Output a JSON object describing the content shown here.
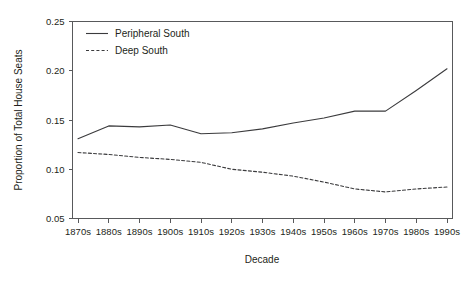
{
  "chart_data": {
    "type": "line",
    "title": "",
    "xlabel": "Decade",
    "ylabel": "Proportion of Total House Seats",
    "categories": [
      "1870s",
      "1880s",
      "1890s",
      "1900s",
      "1910s",
      "1920s",
      "1930s",
      "1940s",
      "1950s",
      "1960s",
      "1970s",
      "1980s",
      "1990s"
    ],
    "x": [
      "1870s",
      "1880s",
      "1890s",
      "1900s",
      "1910s",
      "1920s",
      "1930s",
      "1940s",
      "1950s",
      "1960s",
      "1970s",
      "1980s",
      "1990s"
    ],
    "ylim": [
      0.05,
      0.25
    ],
    "yticks": [
      0.05,
      0.1,
      0.15,
      0.2,
      0.25
    ],
    "ytick_labels": [
      "0.05",
      "0.10",
      "0.15",
      "0.20",
      "0.25"
    ],
    "grid": false,
    "legend_position": "top-left-inside",
    "series": [
      {
        "name": "Peripheral South",
        "style": "solid",
        "color": "#3b3b3d",
        "values": [
          0.131,
          0.144,
          0.143,
          0.145,
          0.136,
          0.137,
          0.141,
          0.147,
          0.152,
          0.159,
          0.159,
          0.18,
          0.202
        ]
      },
      {
        "name": "Deep South",
        "style": "dashed",
        "color": "#3b3b3d",
        "values": [
          0.117,
          0.115,
          0.112,
          0.11,
          0.107,
          0.1,
          0.097,
          0.093,
          0.087,
          0.08,
          0.077,
          0.08,
          0.082
        ]
      }
    ]
  },
  "legend": {
    "entries": [
      {
        "label": "Peripheral South"
      },
      {
        "label": "Deep South"
      }
    ]
  },
  "axes": {
    "x_title": "Decade",
    "y_title": "Proportion of Total House Seats"
  }
}
